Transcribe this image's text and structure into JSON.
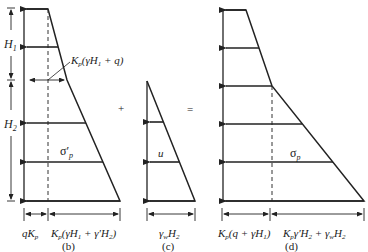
{
  "panels": [
    {
      "id": "b",
      "caption": "(b)",
      "labels": {
        "h1": "H",
        "h1_sub": "1",
        "h2": "H",
        "h2_sub": "2",
        "break_value": "K",
        "break_value_sub": "p",
        "break_value_rest": "(γH",
        "break_value_sub2": "1",
        "break_value_end": " + q)",
        "sigma": "σ′",
        "sigma_sub": "p",
        "bottom_left": "qK",
        "bottom_left_sub": "p",
        "bottom_right_a": "K",
        "bottom_right_sub": "p",
        "bottom_right_b": "(γH",
        "bottom_right_sub2": "1",
        "bottom_right_c": " + γ′H",
        "bottom_right_sub3": "2",
        "bottom_right_d": ")"
      }
    },
    {
      "id": "c",
      "caption": "(c)",
      "labels": {
        "u": "u",
        "bottom_a": "γ",
        "bottom_sub": "w",
        "bottom_b": "H",
        "bottom_sub2": "2"
      }
    },
    {
      "id": "d",
      "caption": "(d)",
      "labels": {
        "sigma": "σ",
        "sigma_sub": "p",
        "bottom_left_a": "K",
        "bottom_left_sub": "p",
        "bottom_left_b": "(q + γH",
        "bottom_left_sub2": "1",
        "bottom_left_c": ")",
        "bottom_right_a": "K",
        "bottom_right_sub": "p",
        "bottom_right_b": "γ′H",
        "bottom_right_sub2": "2",
        "bottom_right_c": " + γ",
        "bottom_right_sub3": "w",
        "bottom_right_d": "H",
        "bottom_right_sub4": "2"
      }
    }
  ],
  "operators": {
    "plus": "+",
    "equals": "="
  }
}
